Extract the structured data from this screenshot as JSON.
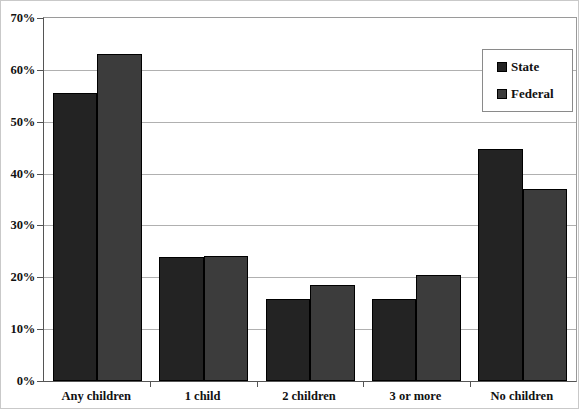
{
  "chart_data": {
    "type": "bar",
    "title": "",
    "subtitle": "",
    "xlabel": "",
    "ylabel": "",
    "categories": [
      "Any children",
      "1 child",
      "2 children",
      "3 or more",
      "No children"
    ],
    "series": [
      {
        "name": "State",
        "color": "#232323",
        "values": [
          55.5,
          24.0,
          15.8,
          15.8,
          44.7
        ]
      },
      {
        "name": "Federal",
        "color": "#3c3c3c",
        "values": [
          63.0,
          24.2,
          18.6,
          20.5,
          37.0
        ]
      }
    ],
    "ylim": [
      0,
      70
    ],
    "ytick_values": [
      0,
      10,
      20,
      30,
      40,
      50,
      60,
      70
    ],
    "ytick_labels": [
      "0%",
      "10%",
      "20%",
      "30%",
      "40%",
      "50%",
      "60%",
      "70%"
    ],
    "grid": true,
    "legend_position": "top-right",
    "legend_entries": [
      "State",
      "Federal"
    ],
    "annotations": []
  },
  "legend": {
    "items": [
      {
        "label": "State",
        "swatch": "legend-swatch-state"
      },
      {
        "label": "Federal",
        "swatch": "legend-swatch-federal"
      }
    ]
  }
}
